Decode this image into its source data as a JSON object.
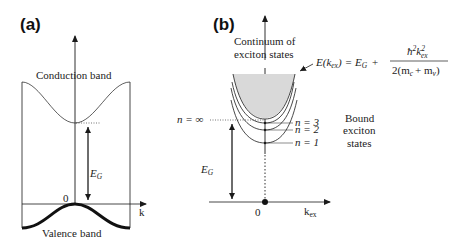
{
  "panel_a": {
    "label": "(a)",
    "conduction_band_label": "Conduction band",
    "valence_band_label_1": "Valence",
    "valence_band_label_2": "band",
    "gap_label": "E",
    "gap_label_sub": "G",
    "origin_label": "0",
    "x_axis_label": "k"
  },
  "panel_b": {
    "label": "(b)",
    "continuum_label_1": "Continuum of",
    "continuum_label_2": "exciton states",
    "formula": {
      "lhs": "E",
      "lhs_arg_open": "(k",
      "lhs_arg_sub": "ex",
      "lhs_arg_close": ")",
      "equals": "=",
      "eg": "E",
      "eg_sub": "G",
      "plus": "+",
      "numerator_hbar": "ħ",
      "numerator_sup": "2",
      "numerator_k": "k",
      "numerator_k_sup": "2",
      "numerator_k_sub": "ex",
      "denominator": "2(m",
      "denominator_c": "c",
      "denominator_plus": "+ m",
      "denominator_v": "v",
      "denominator_close": ")"
    },
    "n_infinity_label": "n = ∞",
    "levels": [
      {
        "label": "n = 3"
      },
      {
        "label": "n = 2"
      },
      {
        "label": "n = 1"
      }
    ],
    "bound_label_1": "Bound",
    "bound_label_2": "exciton",
    "bound_label_3": "states",
    "gap_label": "E",
    "gap_label_sub": "G",
    "origin_label": "0",
    "x_axis_label": "k",
    "x_axis_label_sub": "ex"
  },
  "colors": {
    "line": "#1a1a1a",
    "continuum_fill": "#d9d9d9"
  }
}
